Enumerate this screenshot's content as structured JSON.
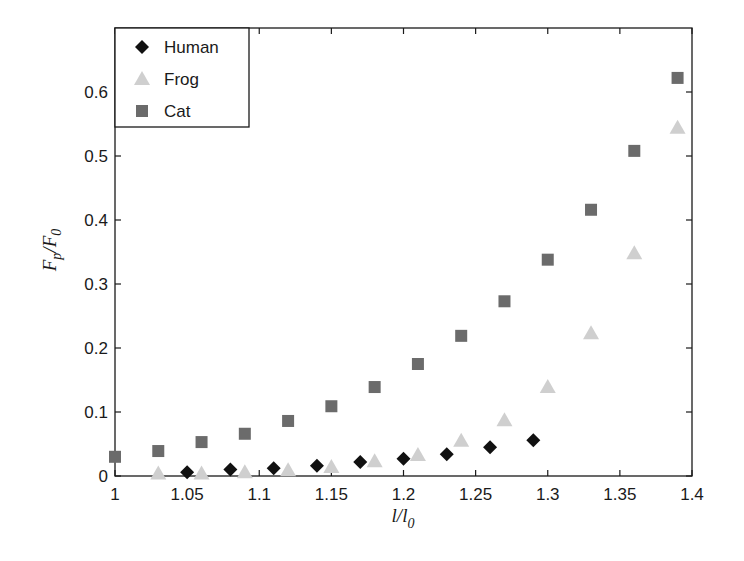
{
  "chart_data": {
    "type": "scatter",
    "title": "",
    "xlabel": "l/l0",
    "ylabel": "Fp/F0",
    "xlim": [
      1,
      1.4
    ],
    "ylim": [
      0,
      0.7
    ],
    "xticks": [
      1,
      1.05,
      1.1,
      1.15,
      1.2,
      1.25,
      1.3,
      1.35,
      1.4
    ],
    "xtick_labels": [
      "1",
      "1.05",
      "1.1",
      "1.15",
      "1.2",
      "1.25",
      "1.3",
      "1.35",
      "1.4"
    ],
    "yticks": [
      0,
      0.1,
      0.2,
      0.3,
      0.4,
      0.5,
      0.6
    ],
    "ytick_labels": [
      "0",
      "0.1",
      "0.2",
      "0.3",
      "0.4",
      "0.5",
      "0.6"
    ],
    "grid": false,
    "legend_position": "top-left",
    "series": [
      {
        "name": "Human",
        "marker": "diamond",
        "color": "#111111",
        "x": [
          1.05,
          1.08,
          1.11,
          1.14,
          1.17,
          1.2,
          1.23,
          1.26,
          1.29
        ],
        "y": [
          0.006,
          0.01,
          0.012,
          0.016,
          0.022,
          0.027,
          0.034,
          0.045,
          0.056
        ]
      },
      {
        "name": "Frog",
        "marker": "triangle",
        "color": "#cfcfcf",
        "x": [
          1.03,
          1.06,
          1.09,
          1.12,
          1.15,
          1.18,
          1.21,
          1.24,
          1.27,
          1.3,
          1.33,
          1.36,
          1.39
        ],
        "y": [
          0.004,
          0.004,
          0.006,
          0.009,
          0.014,
          0.023,
          0.033,
          0.055,
          0.087,
          0.139,
          0.223,
          0.348,
          0.544
        ]
      },
      {
        "name": "Cat",
        "marker": "square",
        "color": "#6b6b6b",
        "x": [
          1.0,
          1.03,
          1.06,
          1.09,
          1.12,
          1.15,
          1.18,
          1.21,
          1.24,
          1.27,
          1.3,
          1.33,
          1.36,
          1.39
        ],
        "y": [
          0.03,
          0.039,
          0.053,
          0.066,
          0.086,
          0.109,
          0.139,
          0.175,
          0.219,
          0.273,
          0.338,
          0.416,
          0.508,
          0.622
        ]
      }
    ]
  }
}
